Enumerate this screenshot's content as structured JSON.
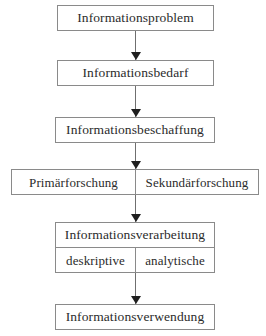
{
  "diagram": {
    "orientation": "vertical top-to-bottom",
    "colors": {
      "background": "#ffffff",
      "box_border": "#8a8a8a",
      "text": "#2b2b2b",
      "connector_line": "#6f6f6f",
      "arrow_head": "#1f1f1f"
    },
    "nodes": [
      {
        "id": "problem",
        "label": "Informationsproblem"
      },
      {
        "id": "bedarf",
        "label": "Informationsbedarf"
      },
      {
        "id": "beschaffung",
        "label": "Informationsbeschaffung"
      },
      {
        "id": "forschung",
        "label_left": "Primärforschung",
        "label_right": "Sekundärforschung"
      },
      {
        "id": "verarbeitung",
        "label": "Informationsverarbeitung",
        "sub_left": "deskriptive",
        "sub_right": "analytische"
      },
      {
        "id": "verwendung",
        "label": "Informationsverwendung"
      }
    ],
    "connectors": [
      {
        "id": "c1",
        "from": "problem",
        "to": "bedarf",
        "type": "arrow-down"
      },
      {
        "id": "c2",
        "from": "bedarf",
        "to": "beschaffung",
        "type": "arrow-down"
      },
      {
        "id": "c3",
        "from": "beschaffung",
        "to": "forschung",
        "type": "arrow-down"
      },
      {
        "id": "c4",
        "from": "forschung",
        "to": "verarbeitung",
        "type": "arrow-down"
      },
      {
        "id": "c5",
        "from": "verarbeitung",
        "to": "verwendung",
        "type": "arrow-down"
      }
    ]
  }
}
